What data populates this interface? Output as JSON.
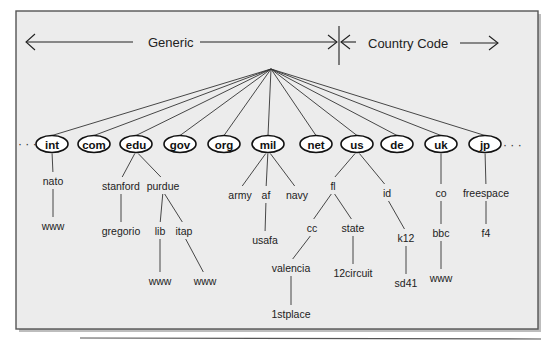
{
  "header": {
    "generic_label": "Generic",
    "country_label": "Country Code"
  },
  "ellipsis": "· · ·",
  "root": {
    "x": 271,
    "y": 69
  },
  "top_level": [
    {
      "id": "int",
      "label": "int",
      "x": 52,
      "group": "generic"
    },
    {
      "id": "com",
      "label": "com",
      "x": 94,
      "group": "generic"
    },
    {
      "id": "edu",
      "label": "edu",
      "x": 136,
      "group": "generic"
    },
    {
      "id": "gov",
      "label": "gov",
      "x": 180,
      "group": "generic"
    },
    {
      "id": "org",
      "label": "org",
      "x": 224,
      "group": "generic"
    },
    {
      "id": "mil",
      "label": "mil",
      "x": 268,
      "group": "generic"
    },
    {
      "id": "net",
      "label": "net",
      "x": 316,
      "group": "generic"
    },
    {
      "id": "us",
      "label": "us",
      "x": 357,
      "group": "country"
    },
    {
      "id": "de",
      "label": "de",
      "x": 397,
      "group": "country"
    },
    {
      "id": "uk",
      "label": "uk",
      "x": 441,
      "group": "country"
    },
    {
      "id": "jp",
      "label": "jp",
      "x": 485,
      "group": "country"
    }
  ],
  "subnodes": [
    {
      "id": "nato",
      "label": "nato",
      "x": 53,
      "y": 181,
      "parent": "int"
    },
    {
      "id": "int-www",
      "label": "www",
      "x": 53,
      "y": 226,
      "parent": "nato"
    },
    {
      "id": "stanford",
      "label": "stanford",
      "x": 121,
      "y": 186,
      "parent": "edu"
    },
    {
      "id": "purdue",
      "label": "purdue",
      "x": 163,
      "y": 186,
      "parent": "edu"
    },
    {
      "id": "gregorio",
      "label": "gregorio",
      "x": 121,
      "y": 231,
      "parent": "stanford"
    },
    {
      "id": "lib",
      "label": "lib",
      "x": 160,
      "y": 231,
      "parent": "purdue"
    },
    {
      "id": "itap",
      "label": "itap",
      "x": 184,
      "y": 231,
      "parent": "purdue"
    },
    {
      "id": "lib-www",
      "label": "www",
      "x": 160,
      "y": 281,
      "parent": "lib"
    },
    {
      "id": "itap-www",
      "label": "www",
      "x": 205,
      "y": 281,
      "parent": "itap"
    },
    {
      "id": "army",
      "label": "army",
      "x": 240,
      "y": 195,
      "parent": "mil"
    },
    {
      "id": "af",
      "label": "af",
      "x": 266,
      "y": 195,
      "parent": "mil"
    },
    {
      "id": "navy",
      "label": "navy",
      "x": 297,
      "y": 195,
      "parent": "mil"
    },
    {
      "id": "usafa",
      "label": "usafa",
      "x": 265,
      "y": 240,
      "parent": "af"
    },
    {
      "id": "fl",
      "label": "fl",
      "x": 333,
      "y": 186,
      "parent": "us"
    },
    {
      "id": "id",
      "label": "id",
      "x": 387,
      "y": 193,
      "parent": "us"
    },
    {
      "id": "cc",
      "label": "cc",
      "x": 312,
      "y": 228,
      "parent": "fl"
    },
    {
      "id": "state",
      "label": "state",
      "x": 353,
      "y": 228,
      "parent": "fl"
    },
    {
      "id": "valencia",
      "label": "valencia",
      "x": 291,
      "y": 268,
      "parent": "cc"
    },
    {
      "id": "12circuit",
      "label": "12circuit",
      "x": 353,
      "y": 273,
      "parent": "state"
    },
    {
      "id": "1stplace",
      "label": "1stplace",
      "x": 291,
      "y": 314,
      "parent": "valencia"
    },
    {
      "id": "k12",
      "label": "k12",
      "x": 406,
      "y": 238,
      "parent": "id"
    },
    {
      "id": "sd41",
      "label": "sd41",
      "x": 406,
      "y": 283,
      "parent": "k12"
    },
    {
      "id": "co",
      "label": "co",
      "x": 441,
      "y": 193,
      "parent": "uk"
    },
    {
      "id": "bbc",
      "label": "bbc",
      "x": 441,
      "y": 233,
      "parent": "co"
    },
    {
      "id": "uk-www",
      "label": "www",
      "x": 441,
      "y": 278,
      "parent": "bbc"
    },
    {
      "id": "freespace",
      "label": "freespace",
      "x": 486,
      "y": 193,
      "parent": "jp"
    },
    {
      "id": "f4",
      "label": "f4",
      "x": 486,
      "y": 233,
      "parent": "freespace"
    }
  ],
  "colors": {
    "frame_fill": "#ececec",
    "frame_stroke": "#555555",
    "line": "#333333",
    "node_fill": "#ffffff"
  }
}
